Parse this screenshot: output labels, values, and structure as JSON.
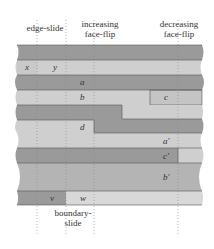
{
  "labels": {
    "edge_slide": "edge-slide",
    "increasing_face_flip_line1": "increasing",
    "increasing_face_flip_line2": "face-flip",
    "decreasing_face_flip_line1": "decreasing",
    "decreasing_face_flip_line2": "face-flip",
    "boundary_slide_line1": "boundary-",
    "boundary_slide_line2": "slide"
  },
  "variables": {
    "x": "x",
    "y": "y",
    "a": "a",
    "b": "b",
    "c": "c",
    "d": "d",
    "a_prime": "a′",
    "c_prime": "c′",
    "b_prime": "b′",
    "v": "v",
    "w": "w"
  },
  "colors": {
    "dark_strip": "#9a9a9a",
    "light_strip": "#cfcfcf",
    "border": "#555555",
    "guide": "#888888"
  }
}
